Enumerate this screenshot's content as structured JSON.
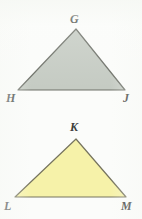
{
  "figure": {
    "background_color": "#fbfcfa",
    "top_cut_text": "· · ·",
    "label_color": "#3b3f3a",
    "shapes": [
      {
        "id": "triangle-ghj",
        "name": "triangle GHJ",
        "fill_color": "#c5cbc3",
        "stroke_color": "#6e7169",
        "stroke_width": 1.2,
        "points": "76,29 125,90 18,90",
        "vertices": [
          {
            "label": "G",
            "x": 76,
            "y": 29
          },
          {
            "label": "H",
            "x": 18,
            "y": 90
          },
          {
            "label": "J",
            "x": 125,
            "y": 90
          }
        ]
      },
      {
        "id": "triangle-klm",
        "name": "triangle KLM",
        "fill_color": "#f6f2a9",
        "stroke_color": "#76745e",
        "stroke_width": 1.2,
        "points": "76,139 126,197 15,197",
        "vertices": [
          {
            "label": "K",
            "x": 76,
            "y": 139
          },
          {
            "label": "L",
            "x": 15,
            "y": 197
          },
          {
            "label": "M",
            "x": 126,
            "y": 197
          }
        ]
      }
    ],
    "labels": {
      "G": "G",
      "H": "H",
      "J": "J",
      "K": "K",
      "L": "L",
      "M": "M"
    }
  }
}
